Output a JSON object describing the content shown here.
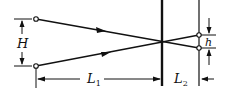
{
  "diagram": {
    "labels": {
      "H": "H",
      "h": "h",
      "L1_main": "L",
      "L1_sub": "1",
      "L2_main": "L",
      "L2_sub": "2"
    },
    "colors": {
      "stroke": "#111111",
      "background": "#ffffff"
    }
  }
}
